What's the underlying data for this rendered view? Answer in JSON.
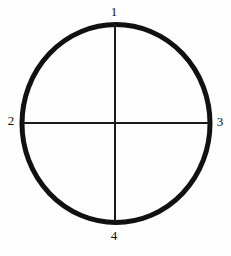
{
  "figure": {
    "background_color": "#fefefe",
    "ink_color": "#111111"
  },
  "diagram": {
    "type": "line-diagram",
    "shape": "circle-with-crosshair",
    "circle": {
      "name": "circle-outline",
      "center_x": 116,
      "center_y": 123,
      "radius_x": 94,
      "radius_y": 99,
      "stroke_color": "#111111",
      "stroke_width": 5,
      "fill": "none"
    },
    "lines": [
      {
        "name": "vertical-diameter",
        "x1": 115,
        "y1": 24,
        "x2": 115,
        "y2": 222,
        "stroke_color": "#1a1a1a",
        "stroke_width": 2
      },
      {
        "name": "horizontal-diameter",
        "x1": 22,
        "y1": 123,
        "x2": 210,
        "y2": 123,
        "stroke_color": "#1a1a1a",
        "stroke_width": 2
      }
    ],
    "intersection_point": {
      "name": "center-point",
      "x": 115,
      "y": 123
    }
  },
  "labels": {
    "top": "1",
    "left": "2",
    "right": "3",
    "bottom": "4"
  },
  "label_positions": {
    "top": {
      "x": 114,
      "y": 12,
      "anchor": "above-circle-top"
    },
    "left": {
      "x": 11,
      "y": 121,
      "anchor": "left-of-circle"
    },
    "right": {
      "x": 220,
      "y": 122,
      "anchor": "right-of-circle"
    },
    "bottom": {
      "x": 114,
      "y": 236,
      "anchor": "below-circle-bottom"
    }
  }
}
